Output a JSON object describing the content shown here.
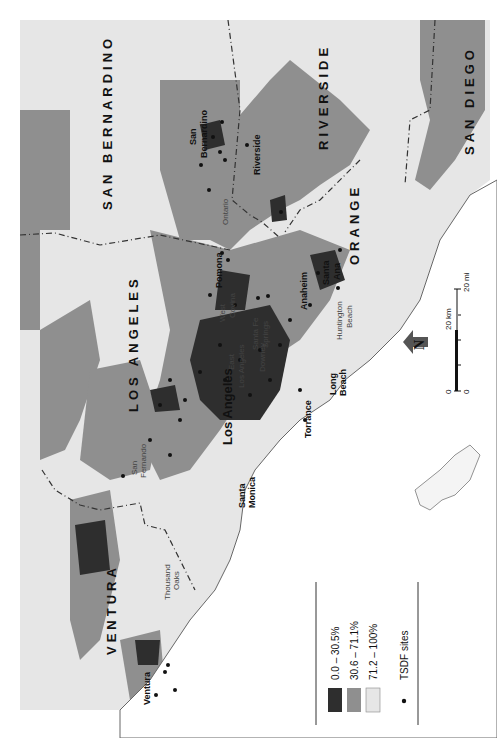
{
  "map": {
    "title": "",
    "orientation": "rotated 90° (north points left)",
    "colors": {
      "class_low": "#2e2e2e",
      "class_mid": "#8f8f8f",
      "class_high": "#e6e6e6",
      "ocean": "#ffffff",
      "tsdf_dot": "#111111",
      "county_border": "#333333"
    },
    "counties": [
      {
        "name": "SAN BERNARDINO"
      },
      {
        "name": "RIVERSIDE"
      },
      {
        "name": "SAN DIEGO"
      },
      {
        "name": "ORANGE"
      },
      {
        "name": "LOS ANGELES"
      },
      {
        "name": "VENTURA"
      }
    ],
    "cities": [
      {
        "name": "San Bernardino",
        "line1": "San",
        "line2": "Bernardino"
      },
      {
        "name": "Riverside"
      },
      {
        "name": "Ontario"
      },
      {
        "name": "Pomona"
      },
      {
        "name": "West Covina",
        "line1": "West",
        "line2": "Covina"
      },
      {
        "name": "Santa Ana",
        "line1": "Santa",
        "line2": "Ana"
      },
      {
        "name": "Anaheim"
      },
      {
        "name": "Huntington Beach",
        "line1": "Huntington",
        "line2": "Beach"
      },
      {
        "name": "Santa Fe Springs",
        "line1": "Santa Fe",
        "line2": "Springs"
      },
      {
        "name": "Downey"
      },
      {
        "name": "East Los Angeles",
        "line1": "East",
        "line2": "Los Angeles"
      },
      {
        "name": "Los Angeles"
      },
      {
        "name": "Long Beach",
        "line1": "Long",
        "line2": "Beach"
      },
      {
        "name": "Torrance"
      },
      {
        "name": "Santa Monica",
        "line1": "Santa",
        "line2": "Monica"
      },
      {
        "name": "San Fernando",
        "line1": "San",
        "line2": "Fernando"
      },
      {
        "name": "Thousand Oaks",
        "line1": "Thousand",
        "line2": "Oaks"
      },
      {
        "name": "Ventura"
      }
    ],
    "legend": {
      "items": [
        {
          "label": "0.0 – 30.5%",
          "swatch": "class_low"
        },
        {
          "label": "30.6 – 71.1%",
          "swatch": "class_mid"
        },
        {
          "label": "71.2 – 100%",
          "swatch": "class_high"
        }
      ],
      "point_label": "TSDF sites"
    },
    "scale_bar": {
      "zero_top": "0",
      "km_label": "20 km",
      "zero_bottom": "0",
      "mi_label": "20 mi"
    },
    "north_arrow": {
      "label": "N"
    }
  }
}
